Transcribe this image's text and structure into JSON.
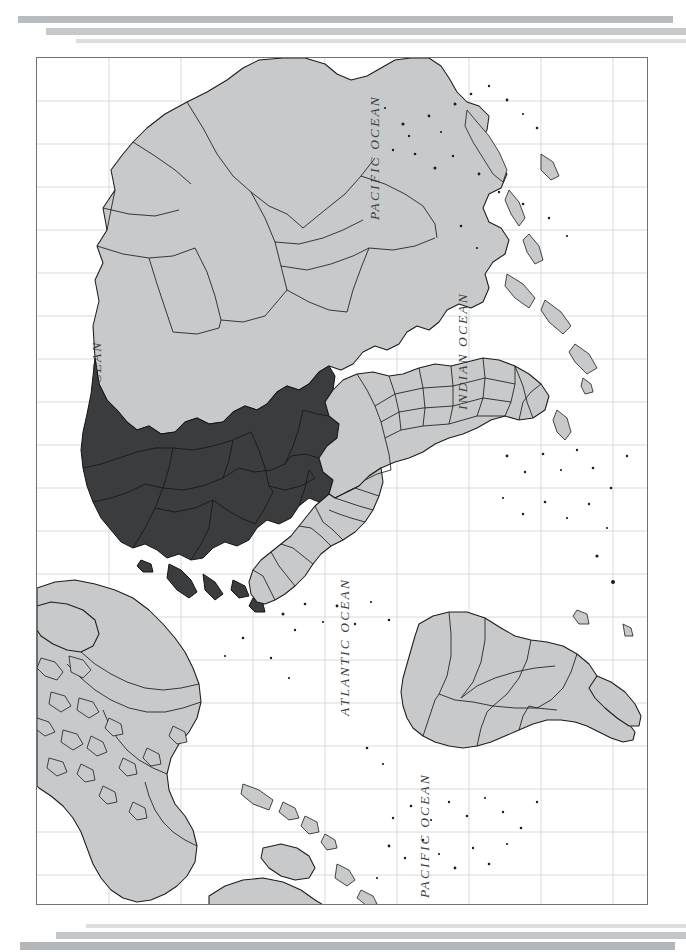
{
  "document": {
    "type": "scanned-page",
    "orientation": "map-rotated-90-ccw",
    "title": "World map page"
  },
  "decor": {
    "top_rules": [
      "rule-top-dark",
      "rule-top-mid",
      "rule-top-light"
    ],
    "bottom_rules": [
      "rule-bottom-light",
      "rule-bottom-mid",
      "rule-bottom-dark"
    ]
  },
  "map": {
    "projection_note": "world political map",
    "colors": {
      "land": "#c8c9ca",
      "highlight": "#3b3c3e",
      "border": "#1c1c1c",
      "grid": "#d7dadc",
      "frame": "#6f7275",
      "ocean": "#ffffff"
    },
    "grid": {
      "vertical_lines": 8,
      "horizontal_lines": 19,
      "visible": true
    },
    "highlight_region": "Europe",
    "labels": [
      {
        "name": "pacific-ocean-north",
        "text": "PACIFIC OCEAN",
        "x": 330,
        "y": 160
      },
      {
        "name": "indian-ocean",
        "text": "INDIAN OCEAN",
        "x": 418,
        "y": 352
      },
      {
        "name": "arctic-ocean",
        "text": "ARCTIC OCEAN",
        "x": 52,
        "y": 400
      },
      {
        "name": "atlantic-ocean",
        "text": "ATLANTIC OCEAN",
        "x": 300,
        "y": 650
      },
      {
        "name": "pacific-ocean-south",
        "text": "PACIFIC OCEAN",
        "x": 380,
        "y": 845
      }
    ]
  }
}
